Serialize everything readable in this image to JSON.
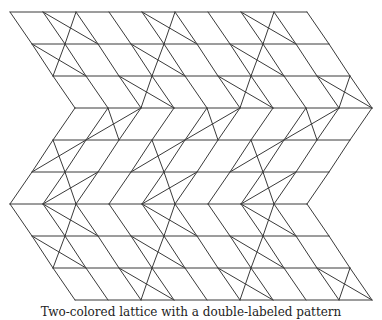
{
  "figure": {
    "type": "zigzag-lattice-diagram",
    "rows": 10,
    "vertices_per_row": 10,
    "row_y": [
      12,
      44,
      76,
      108,
      140,
      172,
      204,
      236,
      268,
      300
    ],
    "row_x_start": [
      10,
      32,
      53,
      75,
      53,
      32,
      10,
      32,
      53,
      75
    ],
    "x_spacing": 33,
    "crossed_cells_by_band": [
      [
        1,
        4,
        7
      ],
      [
        0,
        3,
        6
      ],
      [
        2,
        5,
        8
      ],
      [
        1,
        4,
        7
      ],
      [
        0,
        3,
        6
      ],
      [
        1,
        4,
        7
      ],
      [
        1,
        4,
        7
      ],
      [
        0,
        3,
        6
      ],
      [
        2,
        5,
        8
      ]
    ],
    "line_color": "#3a3a3a",
    "background": "#ffffff"
  },
  "caption": "Two-colored lattice with a double-labeled pattern"
}
